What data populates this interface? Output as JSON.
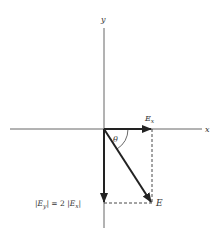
{
  "diagram": {
    "axes": {
      "x_label": "x",
      "y_label": "y"
    },
    "vectors": {
      "ex": {
        "label": "E",
        "subscript": "x"
      },
      "ey": {
        "label": "E",
        "subscript": "y"
      },
      "e": {
        "label": "E"
      }
    },
    "angle_label": "θ",
    "relation": {
      "lhs_open": "|",
      "lhs_E": "E",
      "lhs_sub": "y",
      "lhs_close": "|",
      "equals": " = 2 ",
      "rhs_open": "|",
      "rhs_E": "E",
      "rhs_sub": "x",
      "rhs_close": "|"
    },
    "colors": {
      "axis": "#555555",
      "vector": "#222222",
      "dashed": "#333333",
      "text": "#333333"
    }
  }
}
